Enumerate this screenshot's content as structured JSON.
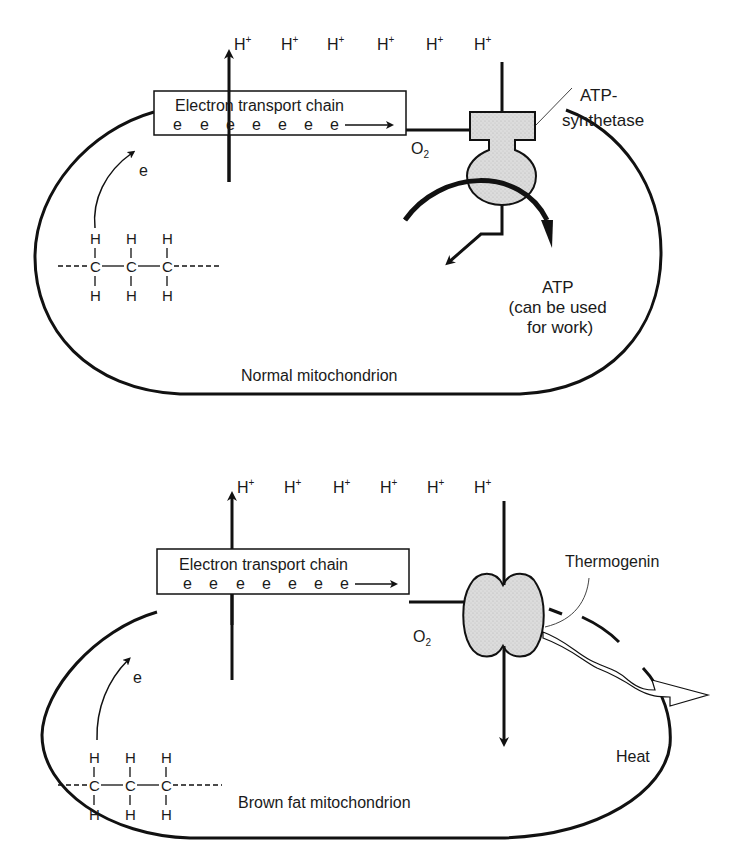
{
  "diagram": {
    "colors": {
      "ink": "#111111",
      "protein_fill": "#d9d9d9",
      "background": "#ffffff"
    },
    "panels": [
      {
        "id": "normal",
        "caption": "Normal mitochondrion",
        "protons": [
          "H",
          "H",
          "H",
          "H",
          "H",
          "H"
        ],
        "proton_charge": "+",
        "etc_label": "Electron transport chain",
        "electrons": [
          "e",
          "e",
          "e",
          "e",
          "e",
          "e",
          "e"
        ],
        "electron_donor_label": "e",
        "oxygen": "O",
        "oxygen_subscript": "2",
        "protein_label": "ATP-\nsynthetase",
        "protein_label_line1": "ATP-",
        "protein_label_line2": "synthetase",
        "product_label_line1": "ATP",
        "product_label_line2": "(can be used",
        "product_label_line3": "for work)",
        "molecule": {
          "top": [
            "H",
            "H",
            "H"
          ],
          "middle": [
            "C",
            "C",
            "C"
          ],
          "bottom": [
            "H",
            "H",
            "H"
          ]
        }
      },
      {
        "id": "brown-fat",
        "caption": "Brown fat mitochondrion",
        "protons": [
          "H",
          "H",
          "H",
          "H",
          "H",
          "H"
        ],
        "proton_charge": "+",
        "etc_label": "Electron transport chain",
        "electrons": [
          "e",
          "e",
          "e",
          "e",
          "e",
          "e",
          "e"
        ],
        "electron_donor_label": "e",
        "oxygen": "O",
        "oxygen_subscript": "2",
        "protein_label": "Thermogenin",
        "product_label": "Heat",
        "molecule": {
          "top": [
            "H",
            "H",
            "H"
          ],
          "middle": [
            "C",
            "C",
            "C"
          ],
          "bottom": [
            "H",
            "H",
            "H"
          ]
        }
      }
    ]
  }
}
